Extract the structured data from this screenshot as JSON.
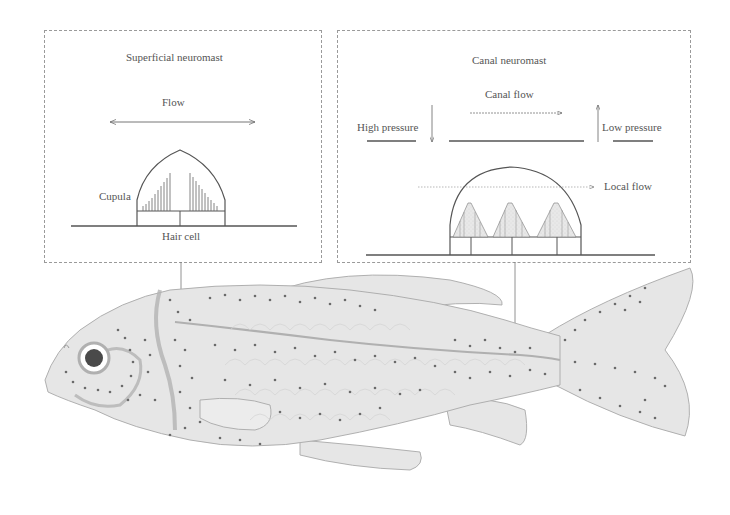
{
  "figure": {
    "type": "anatomical-diagram"
  },
  "panels": {
    "superficial": {
      "title": "Superficial neuromast",
      "flow_label": "Flow",
      "cupula_label": "Cupula",
      "hair_cell_label": "Hair cell"
    },
    "canal": {
      "title": "Canal neuromast",
      "canal_flow_label": "Canal flow",
      "high_pressure_label": "High pressure",
      "low_pressure_label": "Low pressure",
      "local_flow_label": "Local flow"
    }
  },
  "colors": {
    "line": "#555555",
    "fish_fill": "#e6e6e6",
    "fish_outline": "#a8a8a8",
    "neuromast_dot": "#6a6a6a",
    "eye_pupil": "#4a4a4a",
    "panel_border": "#9a9a9a"
  }
}
